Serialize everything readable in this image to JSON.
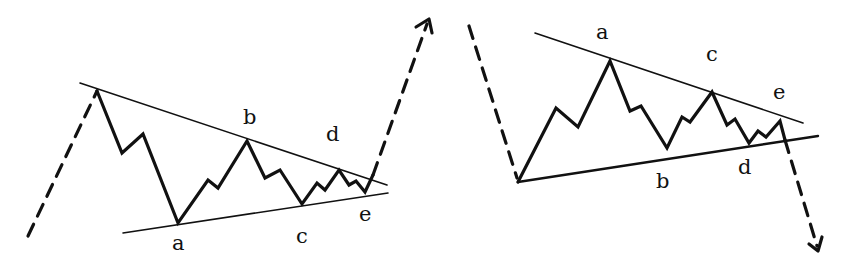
{
  "diagram": {
    "title": "",
    "colors": {
      "stroke": "#111111",
      "background": "#ffffff"
    },
    "left_triangle": {
      "name": "bullish-contracting-triangle",
      "breakout_direction": "up",
      "labels": {
        "a": "a",
        "b": "b",
        "c": "c",
        "d": "d",
        "e": "e"
      }
    },
    "right_triangle": {
      "name": "bearish-contracting-triangle",
      "breakout_direction": "down",
      "labels": {
        "a": "a",
        "b": "b",
        "c": "c",
        "d": "d",
        "e": "e"
      }
    }
  }
}
